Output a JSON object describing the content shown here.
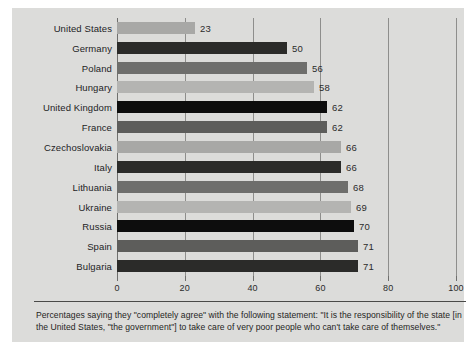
{
  "chart_data": {
    "type": "bar",
    "orientation": "horizontal",
    "title": "",
    "xlabel": "",
    "ylabel": "",
    "xlim": [
      0,
      100
    ],
    "xticks": [
      0,
      20,
      40,
      60,
      80,
      100
    ],
    "grid": true,
    "legend": "none",
    "categories": [
      "United States",
      "Germany",
      "Poland",
      "Hungary",
      "United Kingdom",
      "France",
      "Czechoslovakia",
      "Italy",
      "Lithuania",
      "Ukraine",
      "Russia",
      "Spain",
      "Bulgaria"
    ],
    "values": [
      23,
      50,
      56,
      58,
      62,
      62,
      66,
      66,
      68,
      69,
      70,
      71,
      71
    ],
    "bar_colors": [
      "#a8a8a6",
      "#2b2b29",
      "#6e6e6c",
      "#b4b4b2",
      "#0d0d0d",
      "#5d5d5b",
      "#a8a8a6",
      "#2b2b29",
      "#6e6e6c",
      "#b4b4b2",
      "#0d0d0d",
      "#5d5d5b",
      "#2b2b29"
    ]
  },
  "caption": {
    "text": "Percentages saying they \"completely agree\" with the following statement: \"It is the responsibility of the state [in the United States, \"the government\"] to take care of very poor people who can't take care of themselves.\""
  },
  "colors": {
    "panel_background": "#dcdcda",
    "figure_background": "#ffffff",
    "gridline": "#8e8e8c",
    "axis": "#6f6f6d",
    "text": "#23231f"
  }
}
